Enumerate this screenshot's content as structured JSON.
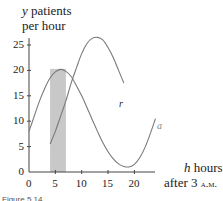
{
  "chart_data": {
    "type": "line",
    "title": "",
    "xlabel": "h hours after 3 A.M.",
    "ylabel": "y patients per hour",
    "xlim": [
      0,
      24
    ],
    "ylim": [
      0,
      27
    ],
    "x_ticks": [
      0,
      5,
      10,
      15,
      20
    ],
    "y_ticks": [
      0,
      5,
      10,
      15,
      20,
      25
    ],
    "grid": false,
    "legend": "inline curve labels",
    "series": [
      {
        "name": "a",
        "x": [
          0,
          1,
          2,
          3,
          4,
          5,
          6,
          7,
          8,
          9,
          10,
          11,
          12,
          13,
          14,
          15,
          16,
          17,
          18,
          19,
          20,
          21,
          22,
          23,
          24
        ],
        "values": [
          8,
          11,
          14,
          16.5,
          18.5,
          19.7,
          20.2,
          19.8,
          18.8,
          17,
          15,
          12.7,
          10.3,
          8,
          5.8,
          4,
          2.6,
          1.6,
          1.1,
          1,
          1.5,
          2.8,
          4.8,
          7.5,
          10.5
        ]
      },
      {
        "name": "r",
        "x": [
          4,
          5,
          6,
          7,
          8,
          9,
          10,
          11,
          12,
          13,
          14,
          15,
          16,
          17,
          18
        ],
        "values": [
          5.5,
          8,
          11,
          14,
          17.5,
          20.5,
          23.3,
          25.3,
          26.3,
          26.5,
          26,
          24.5,
          22.5,
          20,
          17.5
        ]
      }
    ],
    "shaded_region": {
      "x_start": 4,
      "x_end": 7,
      "color": "#c8c8c8"
    },
    "annotations": [
      "a",
      "r"
    ]
  },
  "labels": {
    "y_axis_line1": "y patients",
    "y_axis_line2": "per hour",
    "x_axis_line1_var": "h",
    "x_axis_line1_rest": " hours",
    "x_axis_line2_main": "after 3 ",
    "x_axis_line2_sc": "a.m.",
    "curve_a": "a",
    "curve_r": "r",
    "caption": "Figure 5.14",
    "y_tick_labels": [
      "0",
      "5",
      "10",
      "15",
      "20",
      "25"
    ],
    "x_tick_labels": [
      "0",
      "5",
      "10",
      "15",
      "20"
    ]
  },
  "colors": {
    "curve": "#7a7a7a",
    "axis": "#444444",
    "shade": "#c8c8c8"
  }
}
